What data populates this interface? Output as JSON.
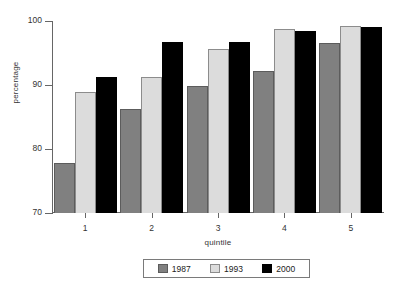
{
  "chart_data": {
    "type": "bar",
    "title": "",
    "xlabel": "quintile",
    "ylabel": "percentage",
    "categories": [
      "1",
      "2",
      "3",
      "4",
      "5"
    ],
    "ylim": [
      70,
      100
    ],
    "yticks": [
      70,
      80,
      90,
      100
    ],
    "grid": false,
    "legend_position": "bottom",
    "series": [
      {
        "name": "1987",
        "color": "#808080",
        "values": [
          77.8,
          86.2,
          89.9,
          92.2,
          96.6
        ]
      },
      {
        "name": "1993",
        "color": "#dcdcdc",
        "values": [
          88.9,
          91.2,
          95.6,
          98.8,
          99.3
        ]
      },
      {
        "name": "2000",
        "color": "#000000",
        "values": [
          91.2,
          96.8,
          96.7,
          98.4,
          99.0
        ]
      }
    ]
  },
  "axes": {
    "y_tick_labels": [
      "100",
      "90",
      "80",
      "70"
    ],
    "y_title": "percentage",
    "x_tick_labels": [
      "1",
      "2",
      "3",
      "4",
      "5"
    ],
    "x_title": "quintile"
  },
  "legend": {
    "items": [
      {
        "label": "1987",
        "swatch": "swatch-1987"
      },
      {
        "label": "1993",
        "swatch": "swatch-1993"
      },
      {
        "label": "2000",
        "swatch": "swatch-2000"
      }
    ]
  }
}
